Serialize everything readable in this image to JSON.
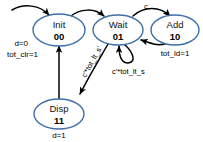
{
  "diagram": {
    "type": "state-transition-diagram",
    "background_color": "#ffffff",
    "state_outline_color": "#3f6fa8",
    "edge_color": "#000000"
  },
  "states": [
    {
      "id": "init",
      "name": "Init",
      "code": "00",
      "outputs": [
        "d=0",
        "tot_clr=1"
      ],
      "output_position": "left"
    },
    {
      "id": "wait",
      "name": "Wait",
      "code": "01",
      "outputs": [],
      "output_position": "none"
    },
    {
      "id": "add",
      "name": "Add",
      "code": "10",
      "outputs": [
        "tot_ld=1"
      ],
      "output_position": "below"
    },
    {
      "id": "disp",
      "name": "Disp",
      "code": "11",
      "outputs": [
        "d=1"
      ],
      "output_position": "below"
    }
  ],
  "transitions": [
    {
      "id": "t-reset",
      "from": "",
      "to": "init",
      "label": "",
      "kind": "initial"
    },
    {
      "id": "t-init-wait",
      "from": "init",
      "to": "wait",
      "label": "",
      "kind": "arc"
    },
    {
      "id": "t-wait-add",
      "from": "wait",
      "to": "add",
      "label": "c",
      "kind": "arc"
    },
    {
      "id": "t-add-wait",
      "from": "add",
      "to": "wait",
      "label": "",
      "kind": "arc"
    },
    {
      "id": "t-wait-self",
      "from": "wait",
      "to": "wait",
      "label": "c'*tot_lt_s",
      "kind": "self-loop"
    },
    {
      "id": "t-wait-disp",
      "from": "wait",
      "to": "disp",
      "label": "c'*tot_lt_s'",
      "kind": "line"
    },
    {
      "id": "t-disp-init",
      "from": "disp",
      "to": "init",
      "label": "",
      "kind": "line"
    }
  ],
  "labels": {
    "init_out_0": "d=0",
    "init_out_1": "tot_clr=1",
    "add_out_0": "tot_ld=1",
    "disp_out_0": "d=1",
    "cond_c": "c",
    "cond_self": "c'*tot_lt_s",
    "cond_disp": "c'*tot_lt_s'"
  }
}
